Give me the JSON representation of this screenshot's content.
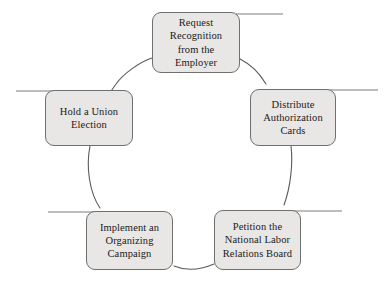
{
  "diagram": {
    "type": "cycle",
    "shape": "circular-ring",
    "step_count": 5,
    "direction": "clockwise",
    "colors": {
      "node_fill": "#e9e7e5",
      "node_border": "#6f6f6f",
      "ring_stroke": "#5a5a5a",
      "leader_stroke": "#7a7a7a",
      "text": "#1a1a1a",
      "background": "#ffffff"
    },
    "nodes": [
      {
        "id": "request",
        "position": "top",
        "text": "Request Recognition from the Employer",
        "lines": [
          "Request",
          "Recognition",
          "from the",
          "Employer"
        ],
        "leader": "top-right"
      },
      {
        "id": "distribute",
        "position": "right",
        "text": "Distribute Authorization Cards",
        "lines": [
          "Distribute",
          "Authorization",
          "Cards"
        ],
        "leader": "right"
      },
      {
        "id": "petition",
        "position": "bottom-right",
        "text": "Petition the National Labor Relations Board",
        "lines": [
          "Petition the",
          "National Labor",
          "Relations Board"
        ],
        "leader": "bottom-right"
      },
      {
        "id": "implement",
        "position": "bottom-left",
        "text": "Implement an Organizing Campaign",
        "lines": [
          "Implement an",
          "Organizing",
          "Campaign"
        ],
        "leader": "bottom-left"
      },
      {
        "id": "hold",
        "position": "left",
        "text": "Hold a Union Election",
        "lines": [
          "Hold a Union",
          "Election"
        ],
        "leader": "left"
      }
    ]
  }
}
